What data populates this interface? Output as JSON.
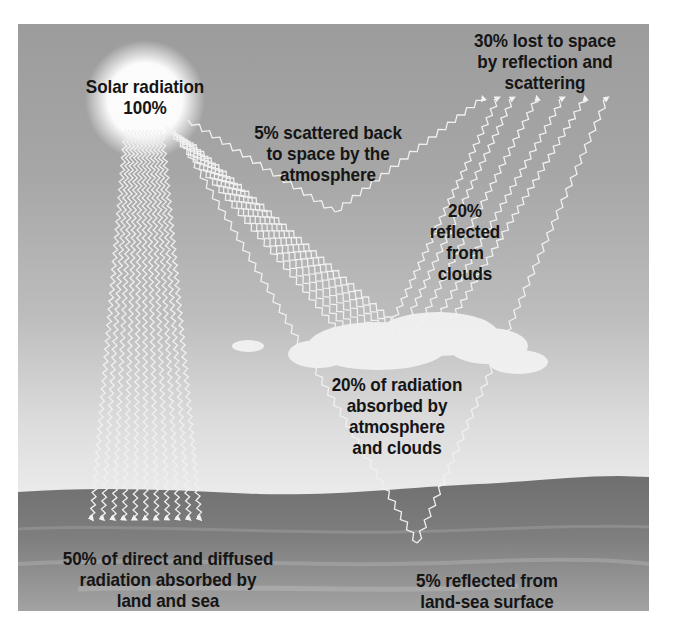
{
  "diagram": {
    "colors": {
      "sky_top": "#9c9c9c",
      "sky_bottom": "#ebebeb",
      "land": "#7d7d7d",
      "ray": "#f2f2f2",
      "text": "#151515"
    },
    "labels": {
      "solar": "Solar radiation\n100%",
      "scattered": "5% scattered back\nto space by the\natmosphere",
      "lost": "30% lost to space\nby reflection and\nscattering",
      "clouds_reflected": "20%\nreflected\nfrom\nclouds",
      "absorbed_atmosphere": "20% of radiation\nabsorbed by\natmosphere\nand clouds",
      "absorbed_land": "50% of direct and diffused\nradiation absorbed by\nland and sea",
      "surface_reflected": "5% reflected from\nland-sea surface"
    },
    "icons": {
      "sun": "sun-icon",
      "cloud": "cloud-icon",
      "ray": "wavy-arrow-icon"
    },
    "flows": [
      {
        "name": "incoming",
        "percent": 100
      },
      {
        "name": "scattered_by_atmosphere",
        "percent": 5
      },
      {
        "name": "reflected_from_clouds",
        "percent": 20
      },
      {
        "name": "reflected_from_surface",
        "percent": 5
      },
      {
        "name": "lost_to_space_total",
        "percent": 30
      },
      {
        "name": "absorbed_by_atmosphere_and_clouds",
        "percent": 20
      },
      {
        "name": "absorbed_by_land_and_sea",
        "percent": 50
      }
    ]
  }
}
